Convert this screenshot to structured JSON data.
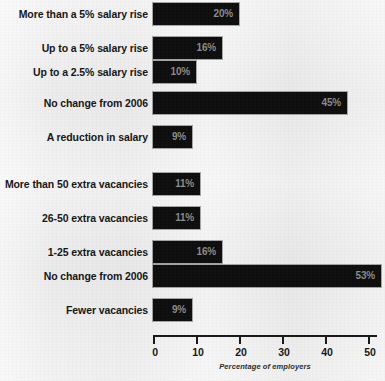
{
  "chart_data": {
    "type": "bar",
    "orientation": "horizontal",
    "title": "",
    "subtitle": "",
    "xlabel": "Percentage of employers",
    "ylabel": "",
    "xlim": [
      0,
      53
    ],
    "xticks": [
      0,
      10,
      20,
      30,
      40,
      50
    ],
    "xtick_labels": [
      "0",
      "10",
      "20",
      "30",
      "40",
      "50"
    ],
    "grid": false,
    "legend": null,
    "value_label_suffix": "%",
    "bar_color": "#0c0c0c",
    "value_label_color": "#8a8a8a",
    "background_color": "#eeeeee",
    "groups": [
      {
        "name": "salary",
        "categories": [
          "More than a 5% salary rise",
          "Up to a 5% salary rise",
          "Up to a 2.5% salary rise",
          "No change from 2006",
          "A reduction in salary"
        ],
        "values": [
          20,
          16,
          10,
          45,
          9
        ],
        "value_labels": [
          "20%",
          "16%",
          "10%",
          "45%",
          "9%"
        ]
      },
      {
        "name": "vacancies",
        "categories": [
          "More than 50 extra vacancies",
          "26-50 extra vacancies",
          "1-25 extra vacancies",
          "No change from 2006",
          "Fewer vacancies"
        ],
        "values": [
          11,
          11,
          16,
          53,
          9
        ],
        "value_labels": [
          "11%",
          "11%",
          "16%",
          "53%",
          "9%"
        ]
      }
    ],
    "categories": [
      "More than a 5% salary rise",
      "Up to a 5% salary rise",
      "Up to a 2.5% salary rise",
      "No change from 2006",
      "A reduction in salary",
      "More than 50 extra vacancies",
      "26-50 extra vacancies",
      "1-25 extra vacancies",
      "No change from 2006",
      "Fewer vacancies"
    ],
    "values": [
      20,
      16,
      10,
      45,
      9,
      11,
      11,
      16,
      53,
      9
    ]
  },
  "bars": [
    {
      "label": "More than a 5% salary rise",
      "value_label": "20%",
      "value": 20,
      "top": 3,
      "group": 0
    },
    {
      "label": "Up to a 5% salary rise",
      "value_label": "16%",
      "value": 16,
      "top": 37,
      "group": 0
    },
    {
      "label": "Up to a 2.5% salary rise",
      "value_label": "10%",
      "value": 10,
      "top": 61,
      "group": 0
    },
    {
      "label": "No change from 2006",
      "value_label": "45%",
      "value": 45,
      "top": 92,
      "group": 0
    },
    {
      "label": "A reduction in salary",
      "value_label": "9%",
      "value": 9,
      "top": 126,
      "group": 0
    },
    {
      "label": "More than 50 extra vacancies",
      "value_label": "11%",
      "value": 11,
      "top": 173,
      "group": 1
    },
    {
      "label": "26-50 extra vacancies",
      "value_label": "11%",
      "value": 11,
      "top": 207,
      "group": 1
    },
    {
      "label": "1-25 extra vacancies",
      "value_label": "16%",
      "value": 16,
      "top": 241,
      "group": 1
    },
    {
      "label": "No change from 2006",
      "value_label": "53%",
      "value": 53,
      "top": 265,
      "group": 1
    },
    {
      "label": "Fewer vacancies",
      "value_label": "9%",
      "value": 9,
      "top": 299,
      "group": 1
    }
  ],
  "axis": {
    "caption": "Percentage of employers",
    "ticks": [
      {
        "label": "0",
        "value": 0
      },
      {
        "label": "10",
        "value": 10
      },
      {
        "label": "20",
        "value": 20
      },
      {
        "label": "30",
        "value": 30
      },
      {
        "label": "40",
        "value": 40
      },
      {
        "label": "50",
        "value": 50
      }
    ]
  },
  "scale": {
    "origin_x": 153,
    "px_per_unit": 4.3
  }
}
